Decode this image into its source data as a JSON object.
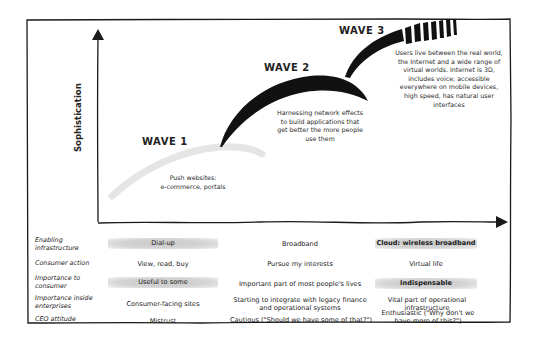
{
  "diagram": {
    "y_axis_label": "Sophistication",
    "waves": [
      {
        "label": "WAVE 1",
        "description": [
          "Push websites:",
          "e-commerce, portals"
        ]
      },
      {
        "label": "WAVE 2",
        "description": [
          "Harnessing network effects",
          "to build applications that",
          "get better the more people",
          "use them"
        ]
      },
      {
        "label": "WAVE 3",
        "description": [
          "Users live between the real world,",
          "the Internet and a wide range of",
          "virtual worlds. Internet is 3D,",
          "includes voice; accessible",
          "everywhere on mobile devices,",
          "high speed, has natural user",
          "interfaces"
        ]
      }
    ]
  },
  "table": {
    "rows": [
      {
        "label": [
          "Enabling",
          "infrastructure"
        ],
        "cells": [
          "Dial-up",
          "Broadband",
          "Cloud: wireless broadband"
        ],
        "shaded": [
          true,
          false,
          true
        ]
      },
      {
        "label": [
          "Consumer action"
        ],
        "cells": [
          "View, read, buy",
          "Pursue my interests",
          "Virtual life"
        ],
        "shaded": [
          false,
          false,
          false
        ]
      },
      {
        "label": [
          "Importance to",
          "consumer"
        ],
        "cells": [
          "Useful to some",
          "Important part of most people's lives",
          "Indispensable"
        ],
        "shaded": [
          true,
          false,
          true
        ]
      },
      {
        "label": [
          "Importance inside",
          "enterprises"
        ],
        "cells": [
          "Consumer-facing sites",
          "Starting to integrate with legacy finance and operational systems",
          "Vital part of operational infrastructure"
        ],
        "shaded": [
          false,
          false,
          false
        ]
      },
      {
        "label": [
          "CEO attitude"
        ],
        "cells": [
          "Mistrust",
          "Cautious (\"Should we have some of that?\")",
          "Enthusiastic (\"Why don't we have more of this?\")"
        ],
        "shaded": [
          false,
          false,
          false
        ]
      }
    ]
  },
  "colors": {
    "ink": "#1a1a1a",
    "shade": "#cfcfcf",
    "background": "#ffffff"
  }
}
